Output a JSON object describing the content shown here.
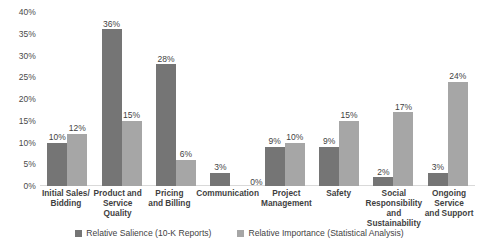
{
  "chart_data": {
    "type": "bar",
    "title": "",
    "xlabel": "",
    "ylabel": "",
    "ylim": [
      0,
      40
    ],
    "grid": false,
    "legend_position": "bottom",
    "ytick_labels": [
      "40%",
      "35%",
      "30%",
      "25%",
      "20%",
      "15%",
      "10%",
      "5%",
      "0%"
    ],
    "ytick_values": [
      40,
      35,
      30,
      25,
      20,
      15,
      10,
      5,
      0
    ],
    "categories": [
      "Initial Sales/ Bidding",
      "Product and Service Quality",
      "Pricing and Billing",
      "Communication",
      "Project Management",
      "Safety",
      "Social Responsibility and Sustainability",
      "Ongoing Service and Support"
    ],
    "category_lines": [
      [
        "Initial Sales/",
        "Bidding"
      ],
      [
        "Product and",
        "Service Quality"
      ],
      [
        "Pricing",
        "and Billing"
      ],
      [
        "Communication"
      ],
      [
        "Project",
        "Management"
      ],
      [
        "Safety"
      ],
      [
        "Social",
        "Responsibility and",
        "Sustainability"
      ],
      [
        "Ongoing",
        "Service",
        "and Support"
      ]
    ],
    "series": [
      {
        "name": "Relative Salience (10-K Reports)",
        "color": "#757575",
        "values": [
          10,
          36,
          28,
          3,
          9,
          9,
          2,
          3
        ],
        "labels": [
          "10%",
          "36%",
          "28%",
          "3%",
          "9%",
          "9%",
          "2%",
          "3%"
        ]
      },
      {
        "name": "Relative Importance (Statistical Analysis)",
        "color": "#a6a6a6",
        "values": [
          12,
          15,
          6,
          0,
          10,
          15,
          17,
          24
        ],
        "labels": [
          "12%",
          "15%",
          "6%",
          "0%",
          "10%",
          "15%",
          "17%",
          "24%"
        ]
      }
    ]
  },
  "legend": {
    "items": [
      {
        "label": "Relative Salience (10-K Reports)"
      },
      {
        "label": "Relative Importance (Statistical Analysis)"
      }
    ]
  }
}
